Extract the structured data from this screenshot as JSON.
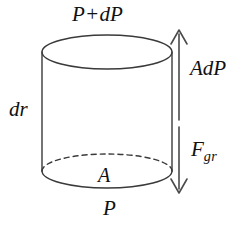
{
  "figure": {
    "background_color": "#ffffff",
    "stroke_color": "#3a3a3a",
    "text_color": "#111111",
    "labels": {
      "top_pressure": "P+dP",
      "bottom_pressure": "P",
      "area": "A",
      "thickness": "dr",
      "force_up_base": "A",
      "force_up_rest": "dP",
      "force_down_base": "F",
      "force_down_subscript": "gr"
    },
    "geometry": {
      "cylinder": {
        "center_x": 107,
        "left_x": 42,
        "right_x": 172,
        "top_ellipse_center_y": 52,
        "bottom_ellipse_center_y": 171,
        "radius_x": 65,
        "radius_y": 17
      },
      "arrows": {
        "axis_x": 179,
        "up_arrow_head_y": 30,
        "up_arrow_tail_y": 120,
        "down_arrow_head_y": 193,
        "down_arrow_tail_y": 127
      }
    }
  }
}
